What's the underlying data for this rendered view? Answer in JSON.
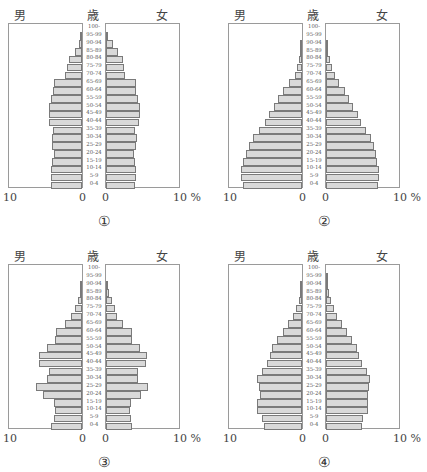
{
  "labels": {
    "male": "男",
    "age": "歳",
    "female": "女",
    "tick_left_max": "10",
    "tick_zero": "0",
    "tick_right_max": "10 %"
  },
  "age_groups": [
    "100-",
    "95-99",
    "90-94",
    "85-89",
    "80-84",
    "75-79",
    "70-74",
    "65-69",
    "60-64",
    "55-59",
    "50-54",
    "45-49",
    "40-44",
    "35-39",
    "30-34",
    "25-29",
    "20-24",
    "15-19",
    "10-14",
    "5-9",
    "0-4"
  ],
  "colors": {
    "bar_fill": "#d9d9d9",
    "bar_edge": "#7a7a7a",
    "frame": "#9a9a9a"
  },
  "chart_data": [
    {
      "type": "bar",
      "id": "①",
      "title": "①",
      "orientation": "horizontal-population-pyramid",
      "xlabel": "%",
      "xlim": [
        0,
        10
      ],
      "legend": [
        "男",
        "女"
      ],
      "categories": [
        "0-4",
        "5-9",
        "10-14",
        "15-19",
        "20-24",
        "25-29",
        "30-34",
        "35-39",
        "40-44",
        "45-49",
        "50-54",
        "55-59",
        "60-64",
        "65-69",
        "70-74",
        "75-79",
        "80-84",
        "85-89",
        "90-94",
        "95-99",
        "100-"
      ],
      "series": [
        {
          "name": "男",
          "values": [
            4.1,
            4.2,
            4.2,
            4.0,
            3.8,
            4.0,
            4.0,
            3.9,
            4.4,
            4.4,
            4.4,
            4.1,
            3.9,
            3.8,
            2.3,
            2.0,
            1.7,
            1.0,
            0.4,
            0.1,
            0.0
          ]
        },
        {
          "name": "女",
          "values": [
            3.9,
            4.0,
            4.0,
            3.8,
            3.7,
            4.0,
            4.1,
            3.9,
            4.4,
            4.5,
            4.5,
            4.2,
            4.0,
            4.0,
            2.5,
            2.4,
            2.2,
            1.6,
            0.9,
            0.2,
            0.0
          ]
        }
      ]
    },
    {
      "type": "bar",
      "id": "②",
      "title": "②",
      "orientation": "horizontal-population-pyramid",
      "xlabel": "%",
      "xlim": [
        0,
        10
      ],
      "legend": [
        "男",
        "女"
      ],
      "categories": [
        "0-4",
        "5-9",
        "10-14",
        "15-19",
        "20-24",
        "25-29",
        "30-34",
        "35-39",
        "40-44",
        "45-49",
        "50-54",
        "55-59",
        "60-64",
        "65-69",
        "70-74",
        "75-79",
        "80-84",
        "85-89",
        "90-94",
        "95-99",
        "100-"
      ],
      "series": [
        {
          "name": "男",
          "values": [
            7.9,
            8.1,
            8.1,
            7.9,
            7.5,
            7.1,
            6.5,
            5.7,
            5.0,
            4.4,
            3.8,
            3.2,
            2.5,
            1.7,
            1.0,
            0.7,
            0.4,
            0.2,
            0.05,
            0.0,
            0.0
          ]
        },
        {
          "name": "女",
          "values": [
            6.9,
            7.0,
            7.0,
            6.8,
            6.6,
            6.4,
            6.0,
            5.3,
            4.7,
            4.2,
            3.6,
            3.1,
            2.5,
            1.7,
            1.2,
            0.8,
            0.5,
            0.3,
            0.1,
            0.0,
            0.0
          ]
        }
      ]
    },
    {
      "type": "bar",
      "id": "③",
      "title": "③",
      "orientation": "horizontal-population-pyramid",
      "xlabel": "%",
      "xlim": [
        0,
        10
      ],
      "legend": [
        "男",
        "女"
      ],
      "categories": [
        "0-4",
        "5-9",
        "10-14",
        "15-19",
        "20-24",
        "25-29",
        "30-34",
        "35-39",
        "40-44",
        "45-49",
        "50-54",
        "55-59",
        "60-64",
        "65-69",
        "70-74",
        "75-79",
        "80-84",
        "85-89",
        "90-94",
        "95-99",
        "100-"
      ],
      "series": [
        {
          "name": "男",
          "values": [
            4.1,
            3.8,
            3.6,
            3.8,
            5.2,
            6.2,
            4.7,
            4.4,
            5.7,
            5.8,
            4.7,
            3.6,
            3.5,
            2.3,
            1.5,
            1.0,
            0.5,
            0.2,
            0.1,
            0.0,
            0.0
          ]
        },
        {
          "name": "女",
          "values": [
            3.5,
            3.3,
            3.2,
            3.3,
            4.6,
            5.6,
            4.3,
            4.3,
            5.3,
            5.5,
            4.5,
            3.5,
            3.5,
            2.2,
            1.5,
            1.2,
            0.8,
            0.4,
            0.1,
            0.0,
            0.0
          ]
        }
      ]
    },
    {
      "type": "bar",
      "id": "④",
      "title": "④",
      "orientation": "horizontal-population-pyramid",
      "xlabel": "%",
      "xlim": [
        0,
        10
      ],
      "legend": [
        "男",
        "女"
      ],
      "categories": [
        "0-4",
        "5-9",
        "10-14",
        "15-19",
        "20-24",
        "25-29",
        "30-34",
        "35-39",
        "40-44",
        "45-49",
        "50-54",
        "55-59",
        "60-64",
        "65-69",
        "70-74",
        "75-79",
        "80-84",
        "85-89",
        "90-94",
        "95-99",
        "100-"
      ],
      "series": [
        {
          "name": "男",
          "values": [
            5.1,
            5.3,
            6.0,
            6.0,
            5.6,
            5.8,
            6.0,
            5.4,
            4.7,
            4.3,
            4.0,
            3.3,
            2.5,
            1.9,
            1.2,
            0.8,
            0.4,
            0.2,
            0.1,
            0.0,
            0.0
          ]
        },
        {
          "name": "女",
          "values": [
            4.8,
            4.9,
            5.6,
            5.6,
            5.6,
            5.7,
            5.9,
            5.5,
            4.8,
            4.4,
            4.1,
            3.5,
            2.8,
            2.1,
            1.5,
            1.1,
            0.6,
            0.4,
            0.2,
            0.1,
            0.0
          ]
        }
      ]
    }
  ]
}
